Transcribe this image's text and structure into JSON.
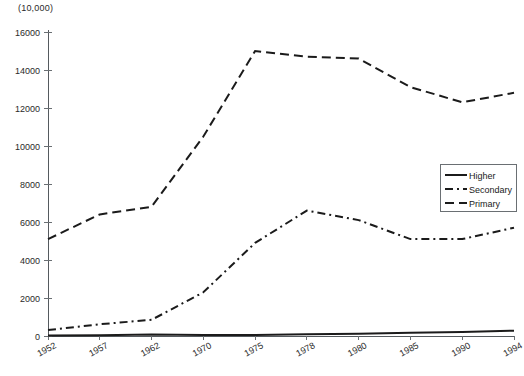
{
  "chart_data": {
    "type": "line",
    "title": "",
    "unit_note": "(10,000)",
    "xlabel": "",
    "ylabel": "",
    "ylim": [
      0,
      16000
    ],
    "ytick_step": 2000,
    "yticks": [
      0,
      2000,
      4000,
      6000,
      8000,
      10000,
      12000,
      14000,
      16000
    ],
    "grid": false,
    "legend_position": "right-middle",
    "categories": [
      "1952",
      "1957",
      "1962",
      "1970",
      "1975",
      "1978",
      "1980",
      "1985",
      "1990",
      "1994"
    ],
    "series": [
      {
        "name": "Higher",
        "style": "solid",
        "values": [
          20,
          45,
          83,
          48,
          50,
          86,
          114,
          170,
          206,
          280
        ]
      },
      {
        "name": "Secondary",
        "style": "dash-dot",
        "values": [
          310,
          620,
          850,
          2300,
          4900,
          6600,
          6100,
          5100,
          5100,
          5700
        ]
      },
      {
        "name": "Primary",
        "style": "dashed",
        "values": [
          5100,
          6400,
          6800,
          10500,
          15000,
          14700,
          14600,
          13100,
          12300,
          12800
        ]
      }
    ]
  },
  "legend": {
    "items": [
      {
        "label": "Higher",
        "style": "solid"
      },
      {
        "label": "Secondary",
        "style": "dash-dot"
      },
      {
        "label": "Primary",
        "style": "dashed"
      }
    ]
  }
}
